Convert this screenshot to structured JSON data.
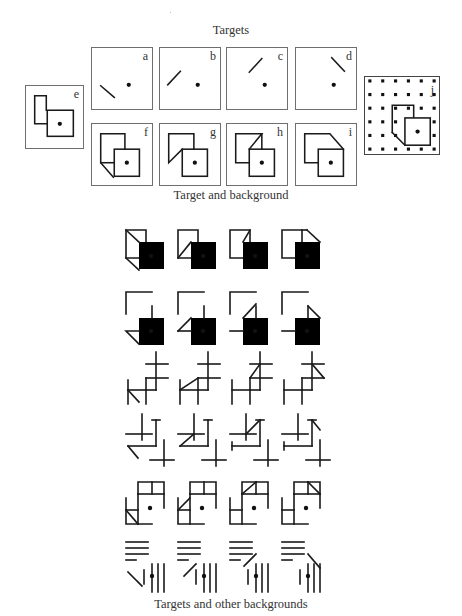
{
  "captions": {
    "targets": "Targets",
    "target_and_background": "Target and background",
    "targets_and_other_backgrounds": "Targets and other backgrounds"
  },
  "panels": [
    {
      "id": "a",
      "label": "a",
      "kind": "line-target",
      "orientation": "backslash-low-left"
    },
    {
      "id": "b",
      "label": "b",
      "kind": "line-target",
      "orientation": "slash-low-left"
    },
    {
      "id": "c",
      "label": "c",
      "kind": "line-target",
      "orientation": "slash-upper"
    },
    {
      "id": "d",
      "label": "d",
      "kind": "line-target",
      "orientation": "backslash-upper"
    },
    {
      "id": "e",
      "label": "e",
      "kind": "overlapping-squares"
    },
    {
      "id": "f",
      "label": "f",
      "kind": "squares-with-fold",
      "fold": "lower-left-backslash"
    },
    {
      "id": "g",
      "label": "g",
      "kind": "squares-with-fold",
      "fold": "lower-left-slash"
    },
    {
      "id": "h",
      "label": "h",
      "kind": "squares-with-fold",
      "fold": "upper-right-slash"
    },
    {
      "id": "i",
      "label": "i",
      "kind": "squares-with-fold",
      "fold": "upper-right-backslash"
    },
    {
      "id": "j",
      "label": "j",
      "kind": "squares-on-dot-grid",
      "dot_grid": {
        "rows": 6,
        "cols": 6
      }
    }
  ],
  "grid": {
    "columns": 4,
    "rows": [
      {
        "name": "occluding-squares",
        "variants": [
          "ll-back",
          "ll-slash",
          "ur-slash",
          "ur-back"
        ]
      },
      {
        "name": "broken-corners",
        "variants": [
          "ll-back",
          "ll-slash",
          "ur-slash",
          "ur-back"
        ]
      },
      {
        "name": "crosses-zigzag",
        "variants": [
          "ll-back",
          "ll-slash",
          "ur-slash",
          "ur-back"
        ]
      },
      {
        "name": "crosses-corners",
        "variants": [
          "ll-back",
          "ll-slash",
          "ur-slash",
          "ur-back"
        ]
      },
      {
        "name": "split-squares",
        "variants": [
          "ll-back",
          "ll-slash",
          "ur-slash",
          "ur-back"
        ]
      },
      {
        "name": "parallel-lines",
        "variants": [
          "ll-back",
          "ll-slash",
          "ur-slash",
          "ur-back"
        ]
      }
    ]
  }
}
